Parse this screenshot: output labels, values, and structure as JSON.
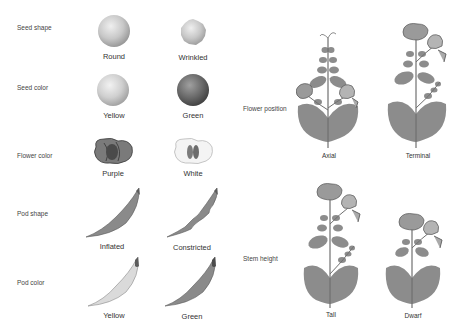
{
  "traits": [
    {
      "name": "Seed shape",
      "variants": [
        "Round",
        "Wrinkled"
      ]
    },
    {
      "name": "Seed color",
      "variants": [
        "Yellow",
        "Green"
      ]
    },
    {
      "name": "Flower color",
      "variants": [
        "Purple",
        "White"
      ]
    },
    {
      "name": "Pod shape",
      "variants": [
        "Inflated",
        "Constricted"
      ]
    },
    {
      "name": "Pod color",
      "variants": [
        "Yellow",
        "Green"
      ]
    },
    {
      "name": "Flower position",
      "variants": [
        "Axial",
        "Terminal"
      ]
    },
    {
      "name": "Stem height",
      "variants": [
        "Tall",
        "Dwarf"
      ]
    }
  ],
  "colors": {
    "seed_light": "#cfcfcf",
    "seed_dark": "#6e6e6e",
    "plant": "#8c8c8c",
    "pod_green": "#8a8a8a",
    "pod_yellow": "#d9d9d9"
  }
}
